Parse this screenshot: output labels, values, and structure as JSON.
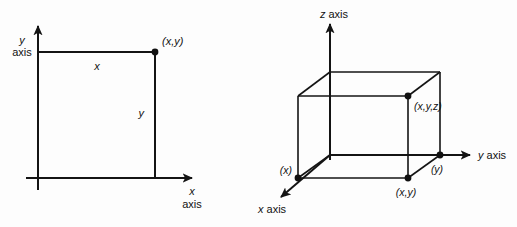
{
  "figure": {
    "background_color": "#fdfdfd",
    "line_color": "#141414",
    "text_color": "#111111"
  },
  "plot_2d": {
    "name": "two-dimensional cartesian plane",
    "y_axis_label_line1": "y",
    "y_axis_label_line2": "axis",
    "x_axis_label_line1": "x",
    "x_axis_label_line2": "axis",
    "edge_label_horizontal": "x",
    "edge_label_vertical": "y",
    "point_label": "(x,y)",
    "points": [
      {
        "name": "xy-point",
        "label": "(x,y)",
        "x": 155,
        "y": 52
      }
    ],
    "axes": {
      "origin": {
        "x": 38,
        "y": 178
      },
      "x_axis_end": {
        "x": 197,
        "y": 178
      },
      "y_axis_end": {
        "x": 38,
        "y": 22
      }
    }
  },
  "plot_3d": {
    "name": "three-dimensional cartesian box",
    "z_axis_label": "z axis",
    "y_axis_label": "y axis",
    "x_axis_label": "x axis",
    "point_labels": {
      "x_intercept": "(x)",
      "y_intercept": "(y)",
      "xy_point": "(x,y)",
      "xyz_point": "(x,y,z)"
    },
    "points": [
      {
        "name": "x-intercept-point",
        "label": "(x)",
        "x": 298,
        "y": 178
      },
      {
        "name": "y-intercept-point",
        "label": "(y)",
        "x": 440,
        "y": 155
      },
      {
        "name": "xy-point",
        "label": "(x,y)",
        "x": 408,
        "y": 178
      },
      {
        "name": "xyz-point",
        "label": "(x,y,z)",
        "x": 408,
        "y": 96
      }
    ],
    "axes": {
      "origin": {
        "x": 330,
        "y": 155
      },
      "z_axis_end": {
        "x": 330,
        "y": 20
      },
      "y_axis_end": {
        "x": 474,
        "y": 155
      },
      "x_axis_end": {
        "x": 277,
        "y": 200
      }
    }
  }
}
